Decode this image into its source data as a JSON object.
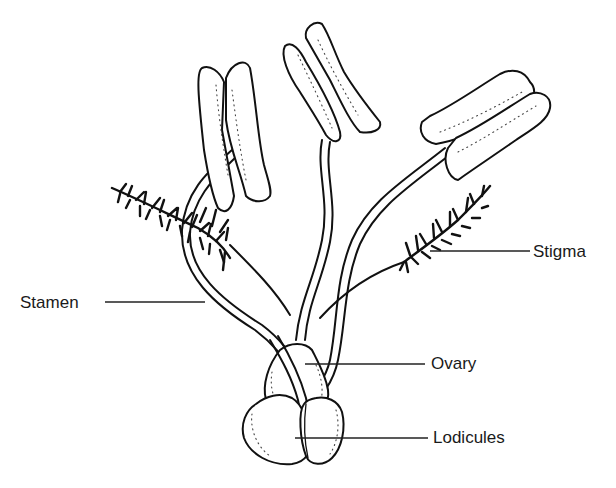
{
  "diagram": {
    "colors": {
      "ink": "#111111",
      "label_text": "#1a1a1a",
      "background": "#ffffff"
    },
    "labels": [
      {
        "id": "stigma",
        "text": "Stigma",
        "x": 533,
        "y": 243,
        "leader": {
          "x1": 430,
          "y1": 251,
          "x2": 530,
          "y2": 251
        }
      },
      {
        "id": "stamen",
        "text": "Stamen",
        "x": 20,
        "y": 294,
        "leader": {
          "x1": 105,
          "y1": 302,
          "x2": 205,
          "y2": 302
        }
      },
      {
        "id": "ovary",
        "text": "Ovary",
        "x": 431,
        "y": 355,
        "leader": {
          "x1": 305,
          "y1": 364,
          "x2": 425,
          "y2": 364
        }
      },
      {
        "id": "lodicules",
        "text": "Lodicules",
        "x": 433,
        "y": 429,
        "leader": {
          "x1": 295,
          "y1": 438,
          "x2": 428,
          "y2": 438
        }
      }
    ],
    "parts": [
      "anther-left",
      "anther-center",
      "anther-right",
      "filament-left",
      "filament-center",
      "filament-right",
      "stigma-left",
      "stigma-right",
      "ovary",
      "lodicules"
    ]
  }
}
